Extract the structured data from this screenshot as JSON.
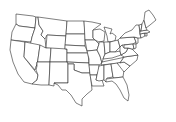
{
  "map": {
    "title": "United States outline map",
    "style": {
      "background": "#ffffff",
      "stroke": "#2a2a2a",
      "fill": "#ffffff"
    },
    "regions": [
      {
        "id": "WA",
        "path": "M16,14 L33,16 L36,17 L35,28 L19,26 L16,24 Z"
      },
      {
        "id": "OR",
        "path": "M16,24 L19,26 L35,28 L32,37 L31,42 L11,40 L12,32 Z"
      },
      {
        "id": "CA",
        "path": "M11,40 L25,42 L24,57 L38,75 L37,80 L32,84 L24,82 L18,74 L13,62 L10,50 Z"
      },
      {
        "id": "ID",
        "path": "M36,17 L38,17 L39,25 L43,31 L41,35 L45,39 L46,48 L30,46 L32,37 L35,28 Z"
      },
      {
        "id": "NV",
        "path": "M25,42 L40,45 L37,66 L36,66 L35,70 L24,57 Z"
      },
      {
        "id": "MT",
        "path": "M38,17 L67,21 L66,36 L47,35 L45,39 L41,35 L43,31 L39,25 Z"
      },
      {
        "id": "WY",
        "path": "M47,35 L66,36 L65,50 L46,48 Z"
      },
      {
        "id": "UT",
        "path": "M40,45 L46,48 L51,48 L50,62 L37,62 L37,66 Z"
      },
      {
        "id": "AZ",
        "path": "M37,62 L50,62 L49,85 L41,85 L32,84 L37,80 L38,75 L36,70 L37,66 Z"
      },
      {
        "id": "CO",
        "path": "M51,48 L67,49 L67,62 L50,62 Z"
      },
      {
        "id": "NM",
        "path": "M50,62 L68,62 L68,83 L54,83 L54,86 L49,85 Z"
      },
      {
        "id": "ND",
        "path": "M67,21 L84,21 L85,34 L66,34 Z"
      },
      {
        "id": "SD",
        "path": "M66,34 L85,34 L85,46 L65,45 Z"
      },
      {
        "id": "NE",
        "path": "M65,45 L85,46 L88,53 L67,53 L67,49 L65,49 Z"
      },
      {
        "id": "KS",
        "path": "M67,53 L88,53 L89,63 L67,62 Z"
      },
      {
        "id": "OK",
        "path": "M67,62 L89,63 L90,73 L82,73 L74,70 L74,64 L68,64 Z"
      },
      {
        "id": "TX",
        "path": "M68,64 L74,64 L74,70 L82,73 L90,73 L91,80 L92,90 L87,94 L82,99 L82,106 L76,103 L71,95 L66,90 L62,90 L58,85 L54,83 L68,83 Z"
      },
      {
        "id": "MN",
        "path": "M84,21 L92,22 L101,24 L93,30 L93,38 L95,40 L85,40 Z"
      },
      {
        "id": "IA",
        "path": "M85,40 L95,40 L99,44 L97,50 L87,51 Z"
      },
      {
        "id": "MO",
        "path": "M87,51 L97,50 L100,56 L102,63 L99,65 L89,65 L89,59 Z"
      },
      {
        "id": "AR",
        "path": "M89,65 L99,65 L99,70 L97,75 L90,75 Z"
      },
      {
        "id": "LA",
        "path": "M90,75 L97,75 L96,80 L102,80 L104,86 L98,86 L92,86 L91,80 Z"
      },
      {
        "id": "WI",
        "path": "M93,30 L100,29 L105,32 L104,41 L99,42 L95,40 L93,38 Z"
      },
      {
        "id": "IL",
        "path": "M99,42 L104,42 L105,54 L103,59 L102,63 L100,56 L97,50 L99,44 Z"
      },
      {
        "id": "MI",
        "path": "M104,27 L112,29 L110,34 L112,33 L116,36 L115,41 L108,42 L107,36 Z"
      },
      {
        "id": "IN",
        "path": "M104,42 L110,42 L110,52 L105,54 Z"
      },
      {
        "id": "OH",
        "path": "M110,42 L118,40 L120,47 L115,52 L110,52 Z"
      },
      {
        "id": "KY",
        "path": "M103,59 L105,54 L110,52 L115,52 L120,51 L121,55 L112,58 Z"
      },
      {
        "id": "TN",
        "path": "M102,62 L121,58 L124,57 L120,63 L101,65 Z"
      },
      {
        "id": "MS",
        "path": "M99,66 L104,65 L104,80 L99,81 L96,80 L97,75 Z"
      },
      {
        "id": "AL",
        "path": "M104,65 L111,64 L113,77 L107,78 L106,82 L104,80 Z"
      },
      {
        "id": "GA",
        "path": "M111,64 L117,63 L124,70 L123,77 L114,78 L113,77 Z"
      },
      {
        "id": "FL",
        "path": "M106,79 L114,78 L123,77 L127,85 L129,95 L128,101 L124,98 L120,90 L116,84 L112,81 L106,82 Z"
      },
      {
        "id": "SC",
        "path": "M117,63 L124,62 L130,66 L124,72 Z"
      },
      {
        "id": "NC",
        "path": "M120,63 L124,57 L138,55 L137,60 L130,66 L124,62 Z"
      },
      {
        "id": "VA",
        "path": "M121,55 L126,52 L128,48 L132,49 L135,52 L138,55 L124,57 Z"
      },
      {
        "id": "WV",
        "path": "M120,47 L122,45 L124,48 L128,48 L126,52 L121,55 L120,51 Z"
      },
      {
        "id": "PA",
        "path": "M118,40 L120,38 L134,37 L136,42 L133,44 L122,45 L120,47 Z"
      },
      {
        "id": "MD",
        "path": "M124,45 L133,44 L134,49 L132,49 L128,48 L124,48 Z"
      },
      {
        "id": "DE",
        "path": "M133,44 L136,44 L136,48 L134,49 Z"
      },
      {
        "id": "NJ",
        "path": "M134,37 L138,38 L138,43 L136,44 L136,42 Z"
      },
      {
        "id": "NY",
        "path": "M120,38 L125,33 L132,30 L136,25 L139,25 L140,34 L141,38 L138,38 L134,37 Z"
      },
      {
        "id": "CT",
        "path": "M140,34 L145,33 L145,36 L141,38 Z"
      },
      {
        "id": "RI",
        "path": "M145,33 L147,33 L147,36 L145,36 Z"
      },
      {
        "id": "MA",
        "path": "M140,31 L147,30 L150,32 L147,33 L145,33 L140,34 Z"
      },
      {
        "id": "VT",
        "path": "M139,25 L142,24 L141,31 L140,31 Z"
      },
      {
        "id": "NH",
        "path": "M142,24 L144,20 L146,28 L147,30 L141,31 Z"
      },
      {
        "id": "ME",
        "path": "M144,20 L145,12 L149,10 L153,15 L156,20 L150,25 L146,28 Z"
      }
    ]
  }
}
